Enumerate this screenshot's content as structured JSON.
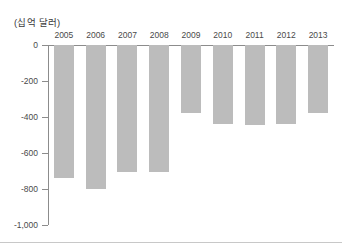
{
  "figure": {
    "unit_label": "(십억 달러)",
    "background_color": "#ffffff",
    "bar_color": "#bcbcbc",
    "axis_color": "#8c8c8c"
  },
  "chart_data": {
    "type": "bar",
    "title": "",
    "subtitle": "",
    "xlabel": "",
    "ylabel": "(십억 달러)",
    "categories": [
      "2005",
      "2006",
      "2007",
      "2008",
      "2009",
      "2010",
      "2011",
      "2012",
      "2013"
    ],
    "values": [
      -740,
      -800,
      -705,
      -705,
      -375,
      -440,
      -445,
      -440,
      -380
    ],
    "ylim": [
      -1000,
      0
    ],
    "ytick_labels": [
      "0",
      "-200",
      "-400",
      "-600",
      "-800",
      "-1,000"
    ],
    "ytick_values": [
      0,
      -200,
      -400,
      -600,
      -800,
      -1000
    ],
    "grid": false,
    "legend": null,
    "series": [
      {
        "name": "",
        "values": [
          -740,
          -800,
          -705,
          -705,
          -375,
          -440,
          -445,
          -440,
          -380
        ]
      }
    ]
  }
}
